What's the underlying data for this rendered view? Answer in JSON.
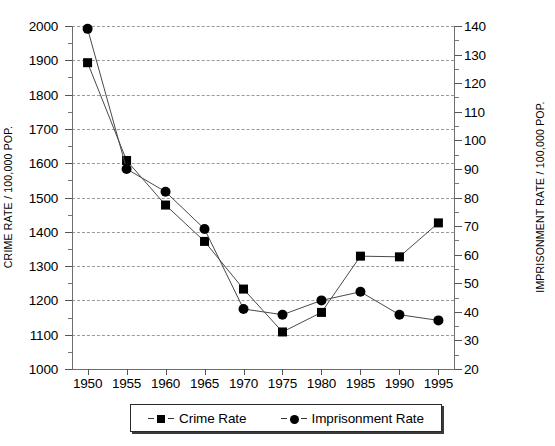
{
  "chart_data": {
    "type": "line",
    "title": "",
    "xlabel": "",
    "ylabel": "CRIME RATE / 100,000 POP.",
    "y2label": "IMPRISONMENT RATE / 100,000 POP.",
    "x": [
      1950,
      1955,
      1960,
      1965,
      1970,
      1975,
      1980,
      1985,
      1990,
      1995
    ],
    "xtick_labels": [
      "1950",
      "1955",
      "1960",
      "1965",
      "1970",
      "1975",
      "1980",
      "1985",
      "1990",
      "1995"
    ],
    "xlim": [
      1948,
      1997
    ],
    "ylim": [
      1000,
      2000
    ],
    "ytick_labels": [
      "1000",
      "1100",
      "1200",
      "1300",
      "1400",
      "1500",
      "1600",
      "1700",
      "1800",
      "1900",
      "2000"
    ],
    "ytick_values": [
      1000,
      1100,
      1200,
      1300,
      1400,
      1500,
      1600,
      1700,
      1800,
      1900,
      2000
    ],
    "y2lim": [
      20,
      140
    ],
    "y2tick_labels": [
      "20",
      "30",
      "40",
      "50",
      "60",
      "70",
      "80",
      "90",
      "100",
      "110",
      "120",
      "130",
      "140"
    ],
    "y2tick_values": [
      20,
      30,
      40,
      50,
      60,
      70,
      80,
      90,
      100,
      110,
      120,
      130,
      140
    ],
    "grid": true,
    "grid_style": "dashed-horizontal",
    "legend_position": "bottom-outside",
    "series": [
      {
        "name": "Crime Rate",
        "axis": "left",
        "marker": "square",
        "color": "#000000",
        "values": [
          1893,
          1608,
          1478,
          1372,
          1233,
          1108,
          1165,
          1329,
          1327,
          1426
        ]
      },
      {
        "name": "Imprisonment Rate",
        "axis": "right",
        "marker": "circle",
        "color": "#000000",
        "values": [
          139,
          90,
          82,
          69,
          41,
          39,
          44,
          47,
          39,
          37
        ]
      }
    ]
  },
  "legend": {
    "entries": [
      {
        "label": "Crime Rate",
        "marker": "square-marker-icon"
      },
      {
        "label": "Imprisonment Rate",
        "marker": "circle-marker-icon"
      }
    ]
  }
}
